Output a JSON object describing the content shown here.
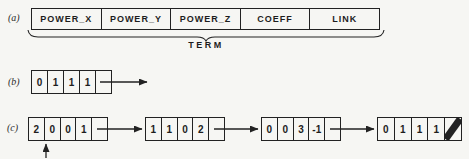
{
  "canvas": {
    "background": "#f6f6f3",
    "ink": "#222222"
  },
  "rows": {
    "a": {
      "label": "(a)",
      "fields": [
        "POWER_X",
        "POWER_Y",
        "POWER_Z",
        "COEFF",
        "LINK"
      ],
      "brace_label": "TERM",
      "brace_icon": "underbrace"
    },
    "b": {
      "label": "(b)",
      "cells": [
        "0",
        "1",
        "1",
        "1",
        ""
      ],
      "link_icon": "right-arrow"
    },
    "c": {
      "label": "(c)",
      "nodes": [
        {
          "cells": [
            "2",
            "0",
            "0",
            "1",
            ""
          ],
          "link_icon": "right-arrow"
        },
        {
          "cells": [
            "1",
            "1",
            "0",
            "2",
            ""
          ],
          "link_icon": "right-arrow"
        },
        {
          "cells": [
            "0",
            "0",
            "3",
            "-1",
            ""
          ],
          "link_icon": "right-arrow"
        },
        {
          "cells": [
            "0",
            "1",
            "1",
            "1",
            ""
          ],
          "link_icon": "null-slash"
        }
      ],
      "pointer_icon": "up-arrow"
    }
  }
}
